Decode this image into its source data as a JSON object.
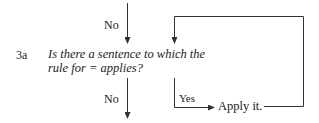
{
  "flowchart": {
    "step_id": "3a",
    "question_line1": "Is there a sentence to which the",
    "question_line2": "rule for = applies?",
    "incoming_label": "No",
    "outgoing_no_label": "No",
    "yes_label": "Yes",
    "action": "Apply it."
  }
}
